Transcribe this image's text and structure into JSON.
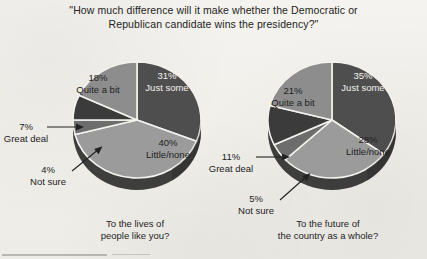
{
  "title": {
    "line1": "\"How much difference will it make whether the Democratic or",
    "line2": "Republican candidate wins the presidency?\""
  },
  "colors": {
    "paper": "#f3f1ed",
    "just_some": "#4e4e4e",
    "little_none": "#9b9b9b",
    "not_sure": "#6d6d6d",
    "great_deal": "#3b3b3b",
    "quite_a_bit": "#8d8d8d",
    "separator": "#f4f2ee",
    "depth": "#2f2f2f",
    "text": "#232323"
  },
  "charts": [
    {
      "id": "lives-of-people-like-you",
      "caption_line1": "To the lives of",
      "caption_line2": "people like you?",
      "slices": [
        {
          "label": "Just some",
          "pct": 31,
          "pct_text": "31%",
          "color_key": "just_some",
          "label_style": "inside-dark"
        },
        {
          "label": "Little/none",
          "pct": 40,
          "pct_text": "40%",
          "color_key": "little_none",
          "label_style": "inside-light"
        },
        {
          "label": "Not sure",
          "pct": 4,
          "pct_text": "4%",
          "color_key": "not_sure",
          "label_style": "callout"
        },
        {
          "label": "Great deal",
          "pct": 7,
          "pct_text": "7%",
          "color_key": "great_deal",
          "label_style": "callout"
        },
        {
          "label": "Quite a bit",
          "pct": 18,
          "pct_text": "18%",
          "color_key": "quite_a_bit",
          "label_style": "inside-light"
        }
      ]
    },
    {
      "id": "future-of-the-country",
      "caption_line1": "To the future of",
      "caption_line2": "the country as a whole?",
      "slices": [
        {
          "label": "Just some",
          "pct": 35,
          "pct_text": "35%",
          "color_key": "just_some",
          "label_style": "inside-dark"
        },
        {
          "label": "Little/none",
          "pct": 28,
          "pct_text": "28%",
          "color_key": "little_none",
          "label_style": "inside-light"
        },
        {
          "label": "Not sure",
          "pct": 5,
          "pct_text": "5%",
          "color_key": "not_sure",
          "label_style": "callout"
        },
        {
          "label": "Great deal",
          "pct": 11,
          "pct_text": "11%",
          "color_key": "great_deal",
          "label_style": "callout"
        },
        {
          "label": "Quite a bit",
          "pct": 21,
          "pct_text": "21%",
          "color_key": "quite_a_bit",
          "label_style": "inside-light"
        }
      ]
    }
  ],
  "chart_data": {
    "type": "pie",
    "title": "\"How much difference will it make whether the Democratic or Republican candidate wins the presidency?\"",
    "categories": [
      "Just some",
      "Little/none",
      "Not sure",
      "Great deal",
      "Quite a bit"
    ],
    "series": [
      {
        "name": "To the lives of people like you?",
        "values": [
          31,
          40,
          4,
          7,
          18
        ]
      },
      {
        "name": "To the future of the country as a whole?",
        "values": [
          35,
          28,
          5,
          11,
          21
        ]
      }
    ],
    "units": "percent",
    "legend": "none",
    "grid": false
  },
  "labels": {
    "left_pie": {
      "just_some": {
        "pct": "31%",
        "name": "Just some"
      },
      "little_none": {
        "pct": "40%",
        "name": "Little/none"
      },
      "quite_a_bit": {
        "pct": "18%",
        "name": "Quite a bit"
      },
      "great_deal": {
        "pct": "7%",
        "name": "Great deal"
      },
      "not_sure": {
        "pct": "4%",
        "name": "Not sure"
      }
    },
    "right_pie": {
      "just_some": {
        "pct": "35%",
        "name": "Just some"
      },
      "little_none": {
        "pct": "28%",
        "name": "Little/none"
      },
      "quite_a_bit": {
        "pct": "21%",
        "name": "Quite a bit"
      },
      "great_deal": {
        "pct": "11%",
        "name": "Great deal"
      },
      "not_sure": {
        "pct": "5%",
        "name": "Not sure"
      }
    }
  }
}
